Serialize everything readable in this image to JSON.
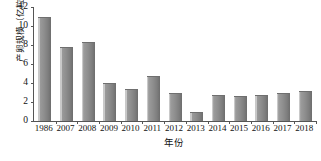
{
  "chart_data": {
    "type": "bar",
    "title": "",
    "xlabel": "年份",
    "ylabel": "产卵规模（亿粒）",
    "categories": [
      "1986",
      "2007",
      "2008",
      "2009",
      "2010",
      "2011",
      "2012",
      "2013",
      "2014",
      "2015",
      "2016",
      "2017",
      "2018"
    ],
    "values": [
      10.9,
      7.8,
      8.3,
      4.0,
      3.4,
      4.7,
      2.9,
      1.0,
      2.7,
      2.6,
      2.7,
      3.0,
      3.2
    ],
    "ylim": [
      0,
      12
    ],
    "yticks": [
      0,
      2,
      4,
      6,
      8,
      10,
      12
    ],
    "ytick_labels": [
      "0",
      "2",
      "4",
      "6",
      "8",
      "10",
      "12"
    ],
    "grid": false,
    "legend": null,
    "legend_position": "none",
    "bar_color": "#8e8e8e",
    "axis_color": "#555555",
    "background_color": "#ffffff"
  }
}
